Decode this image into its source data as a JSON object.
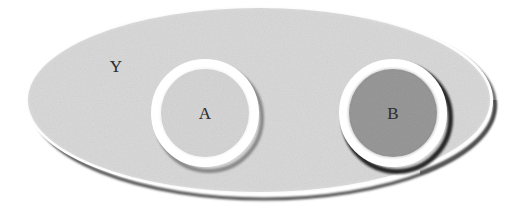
{
  "figure": {
    "kind": "venn-set-diagram",
    "caption_visible": false,
    "background_color": "#ffffff"
  },
  "universe": {
    "name": "universe-ellipse",
    "label": "Y",
    "fill_color": "#d9d9d9",
    "ring_color": "#ffffff",
    "shadow_color": "#4a4a4a",
    "center_x": 259,
    "center_y": 100,
    "radius_x": 231,
    "radius_y": 92
  },
  "sets": [
    {
      "name": "set-a",
      "label": "A",
      "fill_color": "#d6d6d6",
      "ring_color": "#ffffff",
      "shadow_color": "#6e6e6e",
      "center_x": 205,
      "center_y": 113,
      "radius": 53,
      "shaded": false
    },
    {
      "name": "set-b",
      "label": "B",
      "fill_color": "#9a9a9a",
      "ring_color": "#ffffff",
      "shadow_color": "#1d1d1d",
      "center_x": 393,
      "center_y": 113,
      "radius": 53,
      "shaded": true
    }
  ],
  "colors": {
    "page_background": "#ffffff",
    "universe_gray": "#d9d9d9",
    "set_a_gray": "#d6d6d6",
    "set_b_gray": "#9a9a9a",
    "ring_white": "#ffffff",
    "shadow_dark": "#3a3a3a",
    "text_gray": "#2f2f2f"
  },
  "labels": {
    "universe": "Y",
    "set_a": "A",
    "set_b": "B"
  }
}
